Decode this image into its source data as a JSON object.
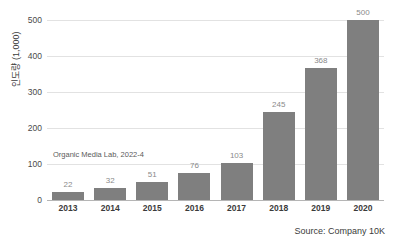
{
  "chart_data": {
    "type": "bar",
    "title": "",
    "subtitle": "",
    "xlabel": "",
    "ylabel": "인도량 (1,000)",
    "categories": [
      "2013",
      "2014",
      "2015",
      "2016",
      "2017",
      "2018",
      "2019",
      "2020"
    ],
    "values": [
      22,
      32,
      51,
      76,
      103,
      245,
      368,
      500
    ],
    "data_labels": [
      "22",
      "32",
      "51",
      "76",
      "103",
      "245",
      "368",
      "500"
    ],
    "ylim": [
      0,
      500
    ],
    "yticks": [
      0,
      100,
      200,
      300,
      400,
      500
    ],
    "ytick_labels": [
      "0",
      "100",
      "200",
      "300",
      "400",
      "500"
    ],
    "grid": true,
    "grid_axis": "y",
    "legend": false,
    "legend_position": "none",
    "series": [
      {
        "name": "인도량",
        "values": [
          22,
          32,
          51,
          76,
          103,
          245,
          368,
          500
        ]
      }
    ],
    "annotations": [
      {
        "text": "Organic Media Lab, 2022-4",
        "x": "2013",
        "y": 118
      }
    ],
    "source_note": "Source: Company 10K",
    "colors": {
      "bar": "#7f7f7f",
      "gridline": "#e2e2e2",
      "baseline": "#b5b5b5",
      "data_label": "#8a8a8a",
      "tick_label": "#3b3b3b",
      "annotation": "#5a5a5a",
      "background": "#ffffff"
    }
  }
}
